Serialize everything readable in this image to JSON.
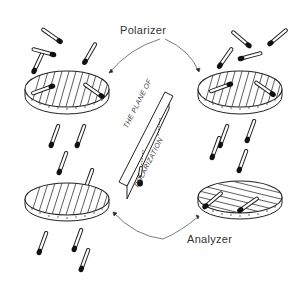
{
  "diagram": {
    "labels": {
      "polarizer": "Polarizer",
      "analyzer": "Analyzer",
      "sign_line1": "THE PLANE OF",
      "sign_line2": "POLARIZATION"
    },
    "colors": {
      "ink": "#222222",
      "background": "#ffffff",
      "label": "#333333"
    },
    "panels": [
      {
        "id": "top-left",
        "role": "polarizer",
        "grating": "vertical",
        "label": "Polarizer"
      },
      {
        "id": "top-right",
        "role": "polarizer",
        "grating": "vertical",
        "label": "Polarizer"
      },
      {
        "id": "bottom-left",
        "role": "analyzer",
        "grating": "vertical",
        "label": "Analyzer"
      },
      {
        "id": "bottom-right",
        "role": "analyzer",
        "grating": "horizontal",
        "label": "Analyzer"
      }
    ]
  }
}
